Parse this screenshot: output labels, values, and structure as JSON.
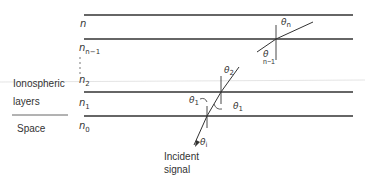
{
  "diagram": {
    "layer_labels": {
      "n": "n",
      "n_minus_1_base": "n",
      "n_minus_1_sub": "n−1",
      "n2_base": "n",
      "n2_sub": "2",
      "n1_base": "n",
      "n1_sub": "1",
      "n0_base": "n",
      "n0_sub": "0"
    },
    "region_labels": {
      "ionospheric_line1": "Ionospheric",
      "ionospheric_line2": "layers",
      "space": "Space"
    },
    "angles": {
      "theta_n_base": "θ",
      "theta_n_sub": "n",
      "theta_n_minus_1_base": "θ",
      "theta_n_minus_1_sub": "n−1",
      "theta_2_base": "θ",
      "theta_2_sub": "2",
      "theta_1_left_base": "θ",
      "theta_1_left_sub": "1",
      "theta_1_right_base": "θ",
      "theta_1_right_sub": "1",
      "theta_i_base": "θ",
      "theta_i_sub": "i"
    },
    "signal_label_line1": "Incident",
    "signal_label_line2": "signal"
  }
}
